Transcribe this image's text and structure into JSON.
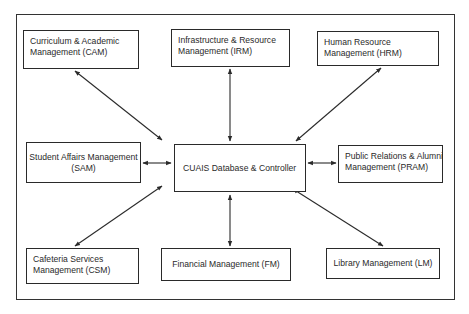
{
  "diagram": {
    "central": {
      "id": "cuais",
      "lines": [
        "CUAIS Database & Controller"
      ]
    },
    "modules": [
      {
        "id": "cam",
        "lines": [
          "Curriculum & Academic",
          "Management (CAM)"
        ]
      },
      {
        "id": "irm",
        "lines": [
          "Infrastructure & Resource",
          "Management (IRM)"
        ]
      },
      {
        "id": "hrm",
        "lines": [
          "Human Resource",
          "Management (HRM)"
        ]
      },
      {
        "id": "sam",
        "lines": [
          "Student Affairs Management",
          "(SAM)"
        ]
      },
      {
        "id": "pram",
        "lines": [
          "Public Relations & Alumni",
          "Management (PRAM)"
        ]
      },
      {
        "id": "csm",
        "lines": [
          "Cafeteria Services",
          "Management (CSM)"
        ]
      },
      {
        "id": "fm",
        "lines": [
          "Financial Management (FM)"
        ]
      },
      {
        "id": "lm",
        "lines": [
          "Library Management (LM)"
        ]
      }
    ],
    "connections": [
      {
        "from": "cuais",
        "to": "cam",
        "type": "bidirectional"
      },
      {
        "from": "cuais",
        "to": "irm",
        "type": "bidirectional"
      },
      {
        "from": "cuais",
        "to": "hrm",
        "type": "bidirectional"
      },
      {
        "from": "cuais",
        "to": "sam",
        "type": "bidirectional"
      },
      {
        "from": "cuais",
        "to": "pram",
        "type": "bidirectional"
      },
      {
        "from": "cuais",
        "to": "csm",
        "type": "bidirectional"
      },
      {
        "from": "cuais",
        "to": "fm",
        "type": "bidirectional"
      },
      {
        "from": "cuais",
        "to": "lm",
        "type": "bidirectional"
      }
    ],
    "colors": {
      "line": "#2a2a2a",
      "background": "#ffffff"
    }
  }
}
